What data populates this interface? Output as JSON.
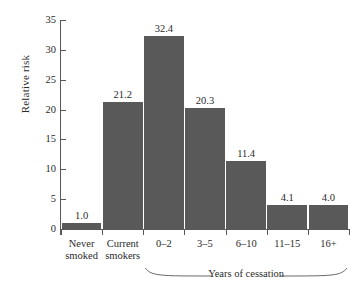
{
  "chart_data": {
    "type": "bar",
    "title": "",
    "xlabel": "",
    "ylabel": "Relative risk",
    "categories": [
      "Never smoked",
      "Current smokers",
      "0–2",
      "3–5",
      "6–10",
      "11–15",
      "16+"
    ],
    "category_lines": [
      [
        "Never",
        "smoked"
      ],
      [
        "Current",
        "smokers"
      ],
      [
        "0–2"
      ],
      [
        "3–5"
      ],
      [
        "6–10"
      ],
      [
        "11–15"
      ],
      [
        "16+"
      ]
    ],
    "values": [
      1.0,
      21.2,
      32.4,
      20.3,
      11.4,
      4.1,
      4.0
    ],
    "value_labels": [
      "1.0",
      "21.2",
      "32.4",
      "20.3",
      "11.4",
      "4.1",
      "4.0"
    ],
    "ylim": [
      0,
      35
    ],
    "yticks": [
      0,
      5,
      10,
      15,
      20,
      25,
      30,
      35
    ],
    "ytick_labels": [
      "0",
      "5",
      "10",
      "15",
      "20",
      "25",
      "30",
      "35"
    ],
    "grid": false,
    "legend": null,
    "annotations": [
      {
        "text": "Years of cessation",
        "type": "brace-group-label",
        "spans_categories": [
          "0–2",
          "3–5",
          "6–10",
          "11–15",
          "16+"
        ]
      }
    ],
    "colors": {
      "bar_fill": "#595959",
      "axis": "#585858",
      "text": "#2b2b2b",
      "background": "#ffffff"
    }
  }
}
